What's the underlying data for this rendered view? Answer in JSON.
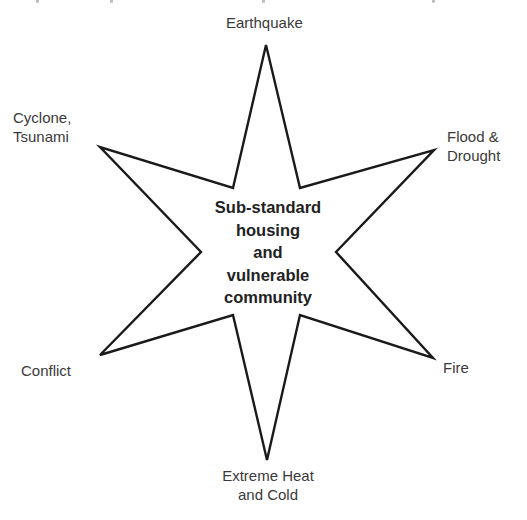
{
  "diagram": {
    "title": "",
    "center": {
      "lines": [
        "Sub-standard",
        "housing",
        "and",
        "vulnerable",
        "community"
      ]
    },
    "hazards": [
      {
        "id": "earthquake",
        "lines": [
          "Earthquake"
        ],
        "position": "top"
      },
      {
        "id": "flood-drought",
        "lines": [
          "Flood &",
          "Drought"
        ],
        "position": "upper-right"
      },
      {
        "id": "fire",
        "lines": [
          "Fire"
        ],
        "position": "lower-right"
      },
      {
        "id": "extreme-heat-cold",
        "lines": [
          "Extreme Heat",
          "and Cold"
        ],
        "position": "bottom"
      },
      {
        "id": "conflict",
        "lines": [
          "Conflict"
        ],
        "position": "lower-left"
      },
      {
        "id": "cyclone-tsunami",
        "lines": [
          "Cyclone,",
          "Tsunami"
        ],
        "position": "upper-left"
      }
    ],
    "shape": "six-pointed star",
    "colors": {
      "outline": "#1a1a1a",
      "fill": "#ffffff",
      "label_text": "#3a3a3a",
      "center_text": "#222222"
    }
  }
}
